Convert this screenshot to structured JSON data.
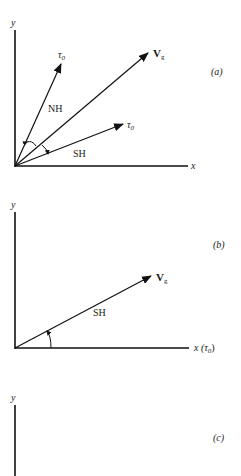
{
  "diagram": {
    "color": "#111111",
    "panels": [
      {
        "id": "a",
        "label": "(a)",
        "axes": {
          "x_label": "x",
          "y_label": "y"
        },
        "vectors": [
          {
            "name": "tau0-nh",
            "label": "τ",
            "sub": "0"
          },
          {
            "name": "vg",
            "label": "V",
            "sub": "g"
          },
          {
            "name": "tau0-sh",
            "label": "τ",
            "sub": "0"
          }
        ],
        "regions": [
          {
            "label": "NH"
          },
          {
            "label": "SH"
          }
        ]
      },
      {
        "id": "b",
        "label": "(b)",
        "axes": {
          "x_label": "x (τ",
          "x_sub": "0",
          "x_close": ")",
          "y_label": "y"
        },
        "vectors": [
          {
            "name": "vg",
            "label": "V",
            "sub": "g"
          }
        ],
        "regions": [
          {
            "label": "SH"
          }
        ]
      },
      {
        "id": "c",
        "label": "(c)",
        "axes": {
          "y_label": "y"
        }
      }
    ]
  }
}
